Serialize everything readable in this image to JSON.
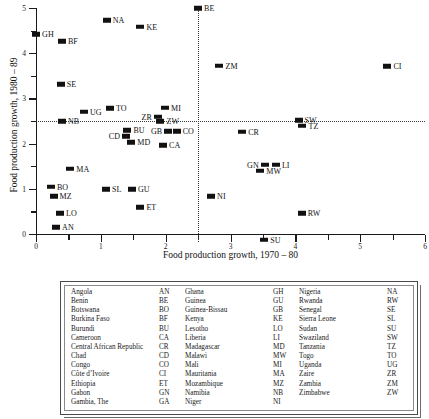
{
  "chart_data": {
    "type": "scatter",
    "title": "",
    "xlabel": "Food production growth, 1970 – 80",
    "ylabel": "Food production growth, 1980 – 89",
    "xlim": [
      0,
      6
    ],
    "ylim": [
      0,
      5
    ],
    "xticks": [
      0,
      1,
      2,
      3,
      4,
      5,
      6
    ],
    "yticks": [
      0,
      1,
      2,
      3,
      4,
      5
    ],
    "minor_tick_step": 0.5,
    "grid": false,
    "legend_position": "below-plot-table",
    "reference_lines": {
      "horizontal_y": 2.5,
      "vertical_x": 2.5,
      "style": "dotted"
    },
    "points": [
      {
        "code": "GH",
        "x": 0.0,
        "y": 4.42,
        "label_side": "right"
      },
      {
        "code": "NA",
        "x": 1.09,
        "y": 4.73,
        "label_side": "right"
      },
      {
        "code": "KE",
        "x": 1.61,
        "y": 4.59,
        "label_side": "right"
      },
      {
        "code": "BE",
        "x": 2.5,
        "y": 4.99,
        "label_side": "right"
      },
      {
        "code": "BF",
        "x": 0.4,
        "y": 4.26,
        "label_side": "right"
      },
      {
        "code": "ZM",
        "x": 2.83,
        "y": 3.72,
        "label_side": "right"
      },
      {
        "code": "CI",
        "x": 5.42,
        "y": 3.71,
        "label_side": "right"
      },
      {
        "code": "SE",
        "x": 0.38,
        "y": 3.31,
        "label_side": "right"
      },
      {
        "code": "UG",
        "x": 0.74,
        "y": 2.7,
        "label_side": "right"
      },
      {
        "code": "TO",
        "x": 1.14,
        "y": 2.78,
        "label_side": "right"
      },
      {
        "code": "ZR",
        "x": 1.88,
        "y": 2.59,
        "label_side": "left"
      },
      {
        "code": "MI",
        "x": 1.99,
        "y": 2.79,
        "label_side": "right"
      },
      {
        "code": "ZW",
        "x": 1.92,
        "y": 2.49,
        "label_side": "right"
      },
      {
        "code": "NB",
        "x": 0.4,
        "y": 2.49,
        "label_side": "right"
      },
      {
        "code": "SW",
        "x": 4.05,
        "y": 2.52,
        "label_side": "right"
      },
      {
        "code": "TZ",
        "x": 4.11,
        "y": 2.4,
        "label_side": "right"
      },
      {
        "code": "BU",
        "x": 1.41,
        "y": 2.3,
        "label_side": "right"
      },
      {
        "code": "CD",
        "x": 1.39,
        "y": 2.16,
        "label_side": "left"
      },
      {
        "code": "GB",
        "x": 2.04,
        "y": 2.27,
        "label_side": "left"
      },
      {
        "code": "CO",
        "x": 2.17,
        "y": 2.27,
        "label_side": "right"
      },
      {
        "code": "CR",
        "x": 3.18,
        "y": 2.26,
        "label_side": "right"
      },
      {
        "code": "MD",
        "x": 1.47,
        "y": 2.03,
        "label_side": "right"
      },
      {
        "code": "CA",
        "x": 1.96,
        "y": 1.96,
        "label_side": "right"
      },
      {
        "code": "GN",
        "x": 3.53,
        "y": 1.53,
        "label_side": "left"
      },
      {
        "code": "LI",
        "x": 3.7,
        "y": 1.53,
        "label_side": "right"
      },
      {
        "code": "MW",
        "x": 3.46,
        "y": 1.4,
        "label_side": "right"
      },
      {
        "code": "MA",
        "x": 0.53,
        "y": 1.44,
        "label_side": "right"
      },
      {
        "code": "BO",
        "x": 0.23,
        "y": 1.04,
        "label_side": "right"
      },
      {
        "code": "SL",
        "x": 1.08,
        "y": 0.99,
        "label_side": "right"
      },
      {
        "code": "GU",
        "x": 1.48,
        "y": 0.99,
        "label_side": "right"
      },
      {
        "code": "MZ",
        "x": 0.27,
        "y": 0.83,
        "label_side": "right"
      },
      {
        "code": "NI",
        "x": 2.7,
        "y": 0.84,
        "label_side": "right"
      },
      {
        "code": "ET",
        "x": 1.61,
        "y": 0.59,
        "label_side": "right"
      },
      {
        "code": "LO",
        "x": 0.37,
        "y": 0.46,
        "label_side": "right"
      },
      {
        "code": "RW",
        "x": 4.1,
        "y": 0.46,
        "label_side": "right"
      },
      {
        "code": "AN",
        "x": 0.31,
        "y": 0.15,
        "label_side": "right"
      },
      {
        "code": "SU",
        "x": 3.52,
        "y": -0.13,
        "label_side": "right"
      }
    ]
  },
  "legend": {
    "columns": [
      {
        "rows": [
          {
            "name": "Angola",
            "code": "AN"
          },
          {
            "name": "Benin",
            "code": "BE"
          },
          {
            "name": "Botswana",
            "code": "BO"
          },
          {
            "name": "Burkina Faso",
            "code": "BF"
          },
          {
            "name": "Burundi",
            "code": "BU"
          },
          {
            "name": "Cameroon",
            "code": "CA"
          },
          {
            "name": "Central African Republic",
            "code": "CR"
          },
          {
            "name": "Chad",
            "code": "CD"
          },
          {
            "name": "Congo",
            "code": "CO"
          },
          {
            "name": "Côte d’Ivoire",
            "code": "CI"
          },
          {
            "name": "Ethiopia",
            "code": "ET"
          },
          {
            "name": "Gabon",
            "code": "GN"
          },
          {
            "name": "Gambia, The",
            "code": "GA"
          }
        ]
      },
      {
        "rows": [
          {
            "name": "Ghana",
            "code": "GH"
          },
          {
            "name": "Guinea",
            "code": "GU"
          },
          {
            "name": "Guinea-Bissau",
            "code": "GB"
          },
          {
            "name": "Kenya",
            "code": "KE"
          },
          {
            "name": "Lesotho",
            "code": "LO"
          },
          {
            "name": "Liberia",
            "code": "LI"
          },
          {
            "name": "Madagascar",
            "code": "MD"
          },
          {
            "name": "Malawi",
            "code": "MW"
          },
          {
            "name": "Mali",
            "code": "MI"
          },
          {
            "name": "Mauritania",
            "code": "MA"
          },
          {
            "name": "Mozambique",
            "code": "MZ"
          },
          {
            "name": "Namibia",
            "code": "NB"
          },
          {
            "name": "Niger",
            "code": "NI"
          }
        ]
      },
      {
        "rows": [
          {
            "name": "Nigeria",
            "code": "NA"
          },
          {
            "name": "Rwanda",
            "code": "RW"
          },
          {
            "name": "Senegal",
            "code": "SE"
          },
          {
            "name": "Sierra Leone",
            "code": "SL"
          },
          {
            "name": "Sudan",
            "code": "SU"
          },
          {
            "name": "Swaziland",
            "code": "SW"
          },
          {
            "name": "Tanzania",
            "code": "TZ"
          },
          {
            "name": "Togo",
            "code": "TO"
          },
          {
            "name": "Uganda",
            "code": "UG"
          },
          {
            "name": "Zaire",
            "code": "ZR"
          },
          {
            "name": "Zambia",
            "code": "ZM"
          },
          {
            "name": "Zimbabwe",
            "code": "ZW"
          }
        ]
      }
    ]
  }
}
